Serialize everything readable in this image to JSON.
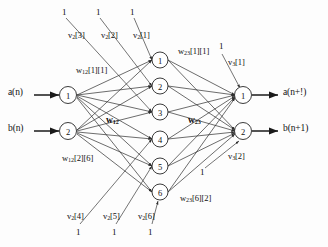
{
  "diagram": {
    "type": "neural-network",
    "colors": {
      "stroke": "#2e2e2e",
      "node_fill": "#ffffff",
      "text": "#111111",
      "background": "#fdfdfd"
    },
    "inputs": [
      {
        "label": "a(n)",
        "node": "1",
        "x": 68,
        "y": 97
      },
      {
        "label": "b(n)",
        "node": "2",
        "x": 68,
        "y": 133
      }
    ],
    "input_signals": [
      {
        "text": "a(n)",
        "x": 8,
        "y": 91
      },
      {
        "text": "b(n)",
        "x": 8,
        "y": 127
      }
    ],
    "hidden_nodes": [
      {
        "label": "1",
        "x": 160,
        "y": 60
      },
      {
        "label": "2",
        "x": 160,
        "y": 86
      },
      {
        "label": "3",
        "x": 160,
        "y": 112
      },
      {
        "label": "4",
        "x": 160,
        "y": 139
      },
      {
        "label": "5",
        "x": 160,
        "y": 166
      },
      {
        "label": "6",
        "x": 160,
        "y": 192
      }
    ],
    "output_nodes": [
      {
        "label": "1",
        "x": 243,
        "y": 97
      },
      {
        "label": "2",
        "x": 243,
        "y": 133
      }
    ],
    "output_signals": [
      {
        "text": "a(n+!)",
        "x": 283,
        "y": 91
      },
      {
        "text": "b(n+1)",
        "x": 283,
        "y": 127
      }
    ],
    "bias_top": [
      {
        "value": "1",
        "x": 62,
        "y": 8
      },
      {
        "value": "1",
        "x": 96,
        "y": 8
      },
      {
        "value": "1",
        "x": 130,
        "y": 8
      }
    ],
    "bias_bottom": [
      {
        "value": "1",
        "x": 76,
        "y": 228
      },
      {
        "value": "1",
        "x": 112,
        "y": 228
      },
      {
        "value": "1",
        "x": 148,
        "y": 228
      }
    ],
    "bias_right": [
      {
        "value": "1",
        "x": 219,
        "y": 46
      },
      {
        "value": "1",
        "x": 200,
        "y": 172
      }
    ],
    "weight_labels": [
      {
        "name": "v2-3",
        "text_main": "v",
        "sub": "2",
        "tail": "[3]",
        "x": 68,
        "y": 31
      },
      {
        "name": "v2-2",
        "text_main": "v",
        "sub": "2",
        "tail": "[2]",
        "x": 101,
        "y": 31
      },
      {
        "name": "v2-1",
        "text_main": "v",
        "sub": "2",
        "tail": "[1]",
        "x": 133,
        "y": 31
      },
      {
        "name": "v2-4",
        "text_main": "v",
        "sub": "2",
        "tail": "[4]",
        "x": 67,
        "y": 216
      },
      {
        "name": "v2-5",
        "text_main": "v",
        "sub": "2",
        "tail": "[5]",
        "x": 103,
        "y": 216
      },
      {
        "name": "v2-6",
        "text_main": "v",
        "sub": "2",
        "tail": "[6]",
        "x": 138,
        "y": 216
      },
      {
        "name": "v3-1",
        "text_main": "v",
        "sub": "3",
        "tail": "[1]",
        "x": 228,
        "y": 62
      },
      {
        "name": "v3-2",
        "text_main": "v",
        "sub": "3",
        "tail": "[2]",
        "x": 228,
        "y": 156
      },
      {
        "name": "w12-1-1",
        "text_main": "w",
        "sub": "12",
        "tail": "[1][1]",
        "x": 76,
        "y": 70
      },
      {
        "name": "w12-2-6",
        "text_main": "w",
        "sub": "12",
        "tail": "[2][6]",
        "x": 62,
        "y": 158
      },
      {
        "name": "w23-1-1",
        "text_main": "w",
        "sub": "23",
        "tail": "[1][1]",
        "x": 178,
        "y": 51
      },
      {
        "name": "w23-6-2",
        "text_main": "w",
        "sub": "23",
        "tail": "[6][2]",
        "x": 180,
        "y": 198
      }
    ],
    "bold_weight_labels": [
      {
        "name": "w12-bold",
        "text_main": "w",
        "sub": "12",
        "x": 106,
        "y": 122
      },
      {
        "name": "w23-bold",
        "text_main": "w",
        "sub": "23",
        "x": 188,
        "y": 122
      }
    ]
  }
}
